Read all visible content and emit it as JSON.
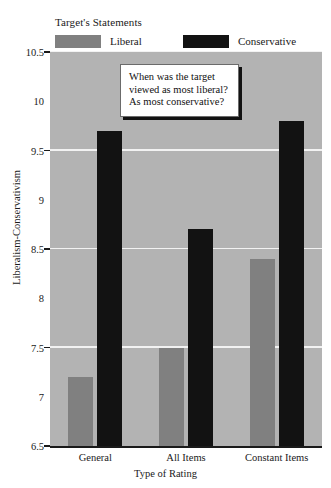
{
  "legend": {
    "title": "Target's Statements",
    "entries": [
      {
        "label": "Liberal",
        "color": "#808080"
      },
      {
        "label": "Conservative",
        "color": "#121212"
      }
    ]
  },
  "annotation": {
    "lines": [
      "When was the target",
      "viewed as most liberal?",
      "As most conservative?"
    ]
  },
  "axes": {
    "y_title": "Liberalism-Conservativism",
    "x_title": "Type of Rating",
    "y_ticks": [
      "10.5",
      "10",
      "9.5",
      "9",
      "8.5",
      "8",
      "7.5",
      "7",
      "6.5"
    ],
    "x_ticks": [
      "General",
      "All Items",
      "Constant Items"
    ]
  },
  "style": {
    "plot_background": "#b3b3b3",
    "gridline_color": "#f2f2f2",
    "axis_color": "#1a1a1a",
    "page_background": "#ffffff"
  },
  "chart_data": {
    "type": "bar",
    "title": "",
    "categories": [
      "General",
      "All Items",
      "Constant Items"
    ],
    "series": [
      {
        "name": "Liberal",
        "color": "#808080",
        "values": [
          7.2,
          7.5,
          8.4
        ]
      },
      {
        "name": "Conservative",
        "color": "#121212",
        "values": [
          9.7,
          8.7,
          9.8
        ]
      }
    ],
    "xlabel": "Type of Rating",
    "ylabel": "Liberalism-Conservativism",
    "ylim": [
      6.5,
      10.5
    ],
    "ytick_step": 0.5,
    "gridlines": [
      7.5,
      8.5,
      9.5,
      10.5
    ],
    "grid": true,
    "legend_position": "top-left",
    "legend_title": "Target's Statements",
    "annotations": [
      "When was the target viewed as most liberal? As most conservative?"
    ]
  }
}
